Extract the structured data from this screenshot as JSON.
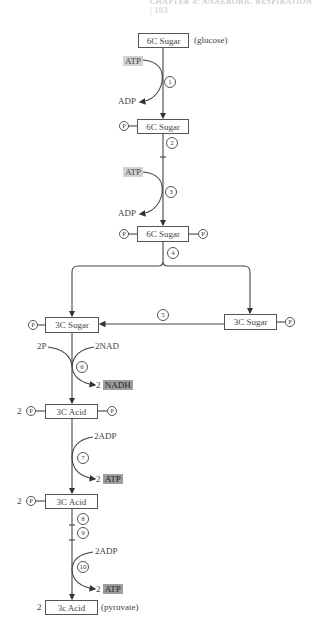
{
  "header": {
    "text": "CHAPTER 4: ANAEROBIC RESPIRATION | 103"
  },
  "nodes": {
    "glucose": {
      "label": "6C Sugar",
      "note": "(glucose)"
    },
    "six_c_p": {
      "label": "6C Sugar",
      "p": "P"
    },
    "six_c_pp": {
      "label": "6C Sugar",
      "p_left": "P",
      "p_right": "P"
    },
    "three_c_left": {
      "label": "3C Sugar",
      "p": "P"
    },
    "three_c_right": {
      "label": "3C Sugar",
      "p": "P"
    },
    "acid_1": {
      "label": "3C Acid",
      "prefix": "2",
      "p_left": "P",
      "p_right": "P"
    },
    "acid_2": {
      "label": "3C Acid",
      "prefix": "2",
      "p": "P"
    },
    "pyruvate": {
      "label": "3c Acid",
      "prefix": "2",
      "note": "(pyruvate)"
    }
  },
  "steps": [
    "1",
    "2",
    "3",
    "4",
    "5",
    "6",
    "7",
    "8",
    "9",
    "10"
  ],
  "inputs": {
    "step1_in": "ATP",
    "step1_out": "ADP",
    "step3_in": "ATP",
    "step3_out": "ADP",
    "step6_in_left": "2P",
    "step6_in_right": "2NAD",
    "step6_out_num": "2",
    "step6_out": "NADH",
    "step7_in": "2ADP",
    "step7_out_num": "2",
    "step7_out": "ATP",
    "step10_in": "2ADP",
    "step10_out_num": "2",
    "step10_out": "ATP"
  },
  "colors": {
    "line": "#444444",
    "atp_light": "#d3d3d3",
    "product_dark": "#9e9e9e"
  }
}
